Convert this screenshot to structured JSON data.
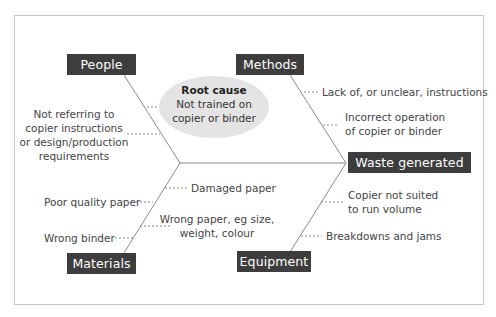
{
  "diagram": {
    "type": "fishbone",
    "effect": "Waste generated",
    "root_cause": {
      "title": "Root cause",
      "text_line1": "Not trained on",
      "text_line2": "copier or binder"
    },
    "categories": {
      "people": {
        "label": "People",
        "causes": [
          {
            "line1": "Not referring to",
            "line2": "copier instructions",
            "line3": "or design/production",
            "line4": "requirements"
          }
        ]
      },
      "methods": {
        "label": "Methods",
        "causes": [
          {
            "line1": "Lack of, or unclear, instructions"
          },
          {
            "line1": "Incorrect operation",
            "line2": "of copier or binder"
          }
        ]
      },
      "materials": {
        "label": "Materials",
        "causes": [
          {
            "line1": "Damaged paper"
          },
          {
            "line1": "Poor quality paper"
          },
          {
            "line1": "Wrong paper, eg size,",
            "line2": "weight, colour"
          },
          {
            "line1": "Wrong binder"
          }
        ]
      },
      "equipment": {
        "label": "Equipment",
        "causes": [
          {
            "line1": "Copier not suited",
            "line2": "to run volume"
          },
          {
            "line1": "Breakdowns and jams"
          }
        ]
      }
    },
    "colors": {
      "box_bg": "#3d3d3d",
      "box_text": "#ffffff",
      "line": "#888888",
      "ellipse": "#e4e4e4",
      "text": "#444444"
    }
  }
}
